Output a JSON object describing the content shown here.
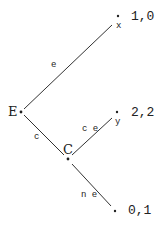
{
  "diagram": {
    "type": "game-tree",
    "nodes": {
      "E": {
        "label": "E"
      },
      "C": {
        "label": "C"
      }
    },
    "edges": {
      "e": {
        "label": "e"
      },
      "c": {
        "label": "c"
      },
      "ce": {
        "label": "c e"
      },
      "ne": {
        "label": "n e"
      }
    },
    "terminals": {
      "x": {
        "label": "x",
        "payoff": "1,0"
      },
      "y": {
        "label": "y",
        "payoff": "2,2"
      },
      "z": {
        "payoff": "0,1"
      }
    },
    "colors": {
      "line": "#333333",
      "text": "#222222",
      "background": "#ffffff"
    }
  }
}
